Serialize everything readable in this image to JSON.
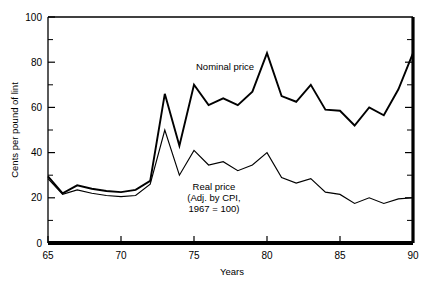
{
  "chart_data": {
    "type": "line",
    "title": "",
    "xlabel": "Years",
    "ylabel": "Cents per pound of lint",
    "xlim": [
      65,
      90
    ],
    "ylim": [
      0,
      100
    ],
    "grid": false,
    "legend_position": "inline-annotation",
    "xticks": [
      65,
      70,
      75,
      80,
      85,
      90
    ],
    "xtick_labels": [
      "65",
      "70",
      "75",
      "80",
      "85",
      "90"
    ],
    "yticks": [
      0,
      20,
      40,
      60,
      80,
      100
    ],
    "ytick_labels": [
      "0",
      "20",
      "40",
      "60",
      "80",
      "100"
    ],
    "yminorticks": [
      10,
      30,
      50,
      70,
      90
    ],
    "x": [
      65,
      66,
      67,
      68,
      69,
      70,
      71,
      72,
      73,
      74,
      75,
      76,
      77,
      78,
      79,
      80,
      81,
      82,
      83,
      84,
      85,
      86,
      87,
      88,
      89,
      90
    ],
    "series": [
      {
        "name": "Nominal price",
        "values": [
          29.5,
          22.0,
          25.5,
          24.0,
          23.0,
          22.5,
          23.5,
          27.5,
          66.0,
          43.0,
          70.0,
          61.0,
          64.0,
          61.0,
          67.0,
          84.0,
          65.0,
          62.5,
          70.0,
          59.0,
          58.5,
          52.0,
          60.0,
          56.5,
          68.0,
          84.0
        ]
      },
      {
        "name": "Real price",
        "values": [
          28.5,
          21.5,
          23.5,
          22.0,
          21.0,
          20.5,
          21.0,
          26.0,
          50.0,
          30.0,
          41.0,
          34.5,
          36.0,
          32.0,
          34.5,
          40.0,
          29.0,
          26.5,
          28.5,
          22.5,
          21.5,
          17.5,
          20.0,
          17.5,
          19.5,
          20.0
        ]
      }
    ],
    "annotations": [
      {
        "name": "nominal-price-label",
        "text": "Nominal price",
        "x": 76.0,
        "y": 76.0
      },
      {
        "name": "real-price-label",
        "lines": [
          "Real price",
          "(Adj. by CPI,",
          "1967 = 100)"
        ],
        "x": 77.0,
        "y": 27.0
      }
    ]
  },
  "axes": {
    "x_title": "Years",
    "y_title": "Cents per pound of lint"
  },
  "annotation_text": {
    "nominal": "Nominal price",
    "real_line_1": "Real price",
    "real_line_2": "(Adj. by CPI,",
    "real_line_3": "1967 = 100)"
  },
  "colors": {
    "axis": "#000000",
    "nominal_line": "#000000",
    "real_line": "#000000",
    "background": "#ffffff"
  }
}
